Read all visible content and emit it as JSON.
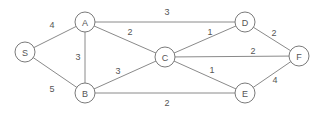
{
  "graph": {
    "colors": {
      "edge": "#8a8a8a",
      "node_stroke": "#7a7a7a",
      "text": "#555555",
      "background": "#ffffff"
    },
    "nodes": [
      {
        "id": "S",
        "label": "S",
        "x": 25,
        "y": 52
      },
      {
        "id": "A",
        "label": "A",
        "x": 85,
        "y": 22
      },
      {
        "id": "B",
        "label": "B",
        "x": 85,
        "y": 93
      },
      {
        "id": "C",
        "label": "C",
        "x": 165,
        "y": 57
      },
      {
        "id": "D",
        "label": "D",
        "x": 245,
        "y": 22
      },
      {
        "id": "E",
        "label": "E",
        "x": 245,
        "y": 93
      },
      {
        "id": "F",
        "label": "F",
        "x": 299,
        "y": 56
      }
    ],
    "edges": [
      {
        "from": "S",
        "to": "A",
        "weight": "4",
        "lx": 52,
        "ly": 25
      },
      {
        "from": "S",
        "to": "B",
        "weight": "5",
        "lx": 52,
        "ly": 89
      },
      {
        "from": "A",
        "to": "B",
        "weight": "3",
        "lx": 78,
        "ly": 57
      },
      {
        "from": "A",
        "to": "C",
        "weight": "2",
        "lx": 130,
        "ly": 32
      },
      {
        "from": "A",
        "to": "D",
        "weight": "3",
        "lx": 167,
        "ly": 12
      },
      {
        "from": "B",
        "to": "C",
        "weight": "3",
        "lx": 118,
        "ly": 71
      },
      {
        "from": "B",
        "to": "E",
        "weight": "2",
        "lx": 167,
        "ly": 103
      },
      {
        "from": "C",
        "to": "D",
        "weight": "1",
        "lx": 210,
        "ly": 32
      },
      {
        "from": "C",
        "to": "F",
        "weight": "2",
        "lx": 253,
        "ly": 51
      },
      {
        "from": "C",
        "to": "E",
        "weight": "1",
        "lx": 212,
        "ly": 70
      },
      {
        "from": "D",
        "to": "F",
        "weight": "2",
        "lx": 274,
        "ly": 33
      },
      {
        "from": "E",
        "to": "F",
        "weight": "4",
        "lx": 275,
        "ly": 80
      }
    ]
  }
}
